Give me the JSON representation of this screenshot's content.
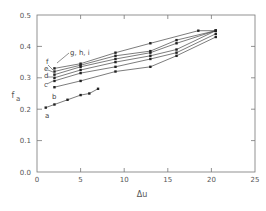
{
  "chart_data": {
    "type": "line",
    "title": "",
    "xlabel": "Δu",
    "ylabel": "f_a",
    "xlim": [
      0,
      25
    ],
    "ylim": [
      0.0,
      0.5
    ],
    "xticks": [
      0,
      5,
      10,
      15,
      20,
      25
    ],
    "yticks": [
      0.0,
      0.1,
      0.2,
      0.3,
      0.4,
      0.5
    ],
    "xtick_labels": [
      "0",
      "5",
      "10",
      "15",
      "20",
      "25"
    ],
    "ytick_labels": [
      "0.0",
      "0.1",
      "0.2",
      "0.3",
      "0.4",
      "0.5"
    ],
    "grid": false,
    "legend": "inline labels a–i with arrows",
    "series": [
      {
        "name": "a",
        "x": [
          1,
          2,
          3.5,
          5,
          6,
          7
        ],
        "y": [
          0.205,
          0.215,
          0.23,
          0.245,
          0.25,
          0.265
        ]
      },
      {
        "name": "b",
        "x": [
          2,
          5,
          9,
          13,
          16,
          20.5
        ],
        "y": [
          0.27,
          0.29,
          0.32,
          0.335,
          0.37,
          0.43
        ]
      },
      {
        "name": "c",
        "x": [
          2,
          5,
          9,
          13,
          16,
          20.5
        ],
        "y": [
          0.29,
          0.315,
          0.335,
          0.36,
          0.38,
          0.44
        ]
      },
      {
        "name": "d",
        "x": [
          2,
          5,
          9,
          13,
          16,
          20.5
        ],
        "y": [
          0.3,
          0.325,
          0.35,
          0.37,
          0.39,
          0.45
        ]
      },
      {
        "name": "e",
        "x": [
          2,
          5,
          9,
          13,
          16,
          20.5
        ],
        "y": [
          0.31,
          0.335,
          0.36,
          0.38,
          0.41,
          0.45
        ]
      },
      {
        "name": "f",
        "x": [
          2,
          5,
          9,
          13,
          16,
          20.5
        ],
        "y": [
          0.32,
          0.34,
          0.37,
          0.385,
          0.42,
          0.45
        ]
      },
      {
        "name": "g,h,i",
        "x": [
          2,
          5,
          9,
          13,
          18.5,
          20.5
        ],
        "y": [
          0.33,
          0.345,
          0.38,
          0.41,
          0.45,
          0.45
        ]
      }
    ],
    "annotations": [
      "a",
      "b",
      "c",
      "d",
      "e",
      "f",
      "g, h, i"
    ]
  }
}
